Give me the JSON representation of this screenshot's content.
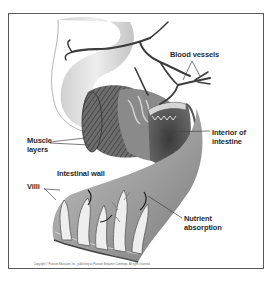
{
  "diagram": {
    "labels": {
      "blood_vessels": "Blood vessels",
      "interior_line1": "Interior of",
      "interior_line2": "intestine",
      "muscle_line1": "Muscle",
      "muscle_line2": "layers",
      "intestinal_wall": "Intestinal wall",
      "villi": "Villi",
      "nutrient_line1": "Nutrient",
      "nutrient_line2": "absorption"
    },
    "copyright": "Copyright © Pearson Education, Inc., publishing as Pearson Benjamin Cummings. All rights reserved.",
    "colors": {
      "frame": "#5a5a5a",
      "tissue_light": "#d9d9d9",
      "tissue_mid": "#a8a8a8",
      "tissue_dark": "#4a4a4a",
      "vessel": "#3c3c3c",
      "text": "#2a2a2a"
    }
  }
}
